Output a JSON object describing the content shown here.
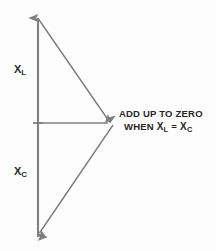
{
  "figure": {
    "background_color": "#fdfdfd",
    "vector_color": "#808080",
    "text_color": "#262626",
    "width": 216,
    "height": 251
  },
  "labels": {
    "inductive": {
      "symbol": "X",
      "subscript": "L",
      "full": "XL"
    },
    "capacitive": {
      "symbol": "X",
      "subscript": "C",
      "full": "XC"
    }
  },
  "annotation": {
    "line1": "ADD UP TO ZERO",
    "line2_prefix": "WHEN",
    "line2_left_symbol": "X",
    "line2_left_subscript": "L",
    "line2_operator": "=",
    "line2_right_symbol": "X",
    "line2_right_subscript": "C",
    "line2_full": "WHEN XL = XC"
  },
  "geometry": {
    "axis_top": {
      "x": 38,
      "y": 18
    },
    "axis_bottom": {
      "x": 38,
      "y": 237
    },
    "origin": {
      "x": 38,
      "y": 123
    },
    "vertex": {
      "x": 113,
      "y": 123
    },
    "tick_half_width": 5
  }
}
